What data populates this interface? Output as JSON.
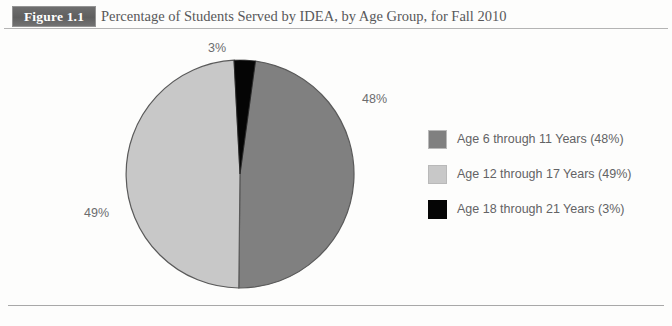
{
  "figure": {
    "tag": "Figure 1.1",
    "title": "Percentage of Students Served by IDEA, by Age Group, for Fall 2010"
  },
  "colors": {
    "series_dark_gray": "#808080",
    "series_light_gray": "#c8c8c8",
    "series_black": "#050505",
    "slice_outline": "#5a5a5a",
    "tag_background": "#646464",
    "rule": "#b4b4b4",
    "text": "#636365"
  },
  "slice_labels": {
    "top": "3%",
    "right": "48%",
    "left": "49%"
  },
  "legend": {
    "items": [
      {
        "label": "Age 6 through 11 Years (48%)",
        "swatch": "#808080",
        "swatch_name": "legend-swatch-age-6-11"
      },
      {
        "label": "Age 12 through 17 Years (49%)",
        "swatch": "#c8c8c8",
        "swatch_name": "legend-swatch-age-12-17"
      },
      {
        "label": "Age 18 through 21 Years (3%)",
        "swatch": "#050505",
        "swatch_name": "legend-swatch-age-18-21"
      }
    ]
  },
  "chart_data": {
    "type": "pie",
    "title": "Percentage of Students Served by IDEA, by Age Group, for Fall 2010",
    "categories": [
      "Age 6 through 11 Years",
      "Age 12 through 17 Years",
      "Age 18 through 21 Years"
    ],
    "values": [
      48,
      49,
      3
    ],
    "value_labels": [
      "48%",
      "49%",
      "3%"
    ],
    "units": "percent",
    "colors": [
      "#808080",
      "#c8c8c8",
      "#050505"
    ],
    "legend_position": "right",
    "grid": false,
    "start_angle_deg": 3,
    "direction": "clockwise",
    "xlabel": "",
    "ylabel": ""
  }
}
